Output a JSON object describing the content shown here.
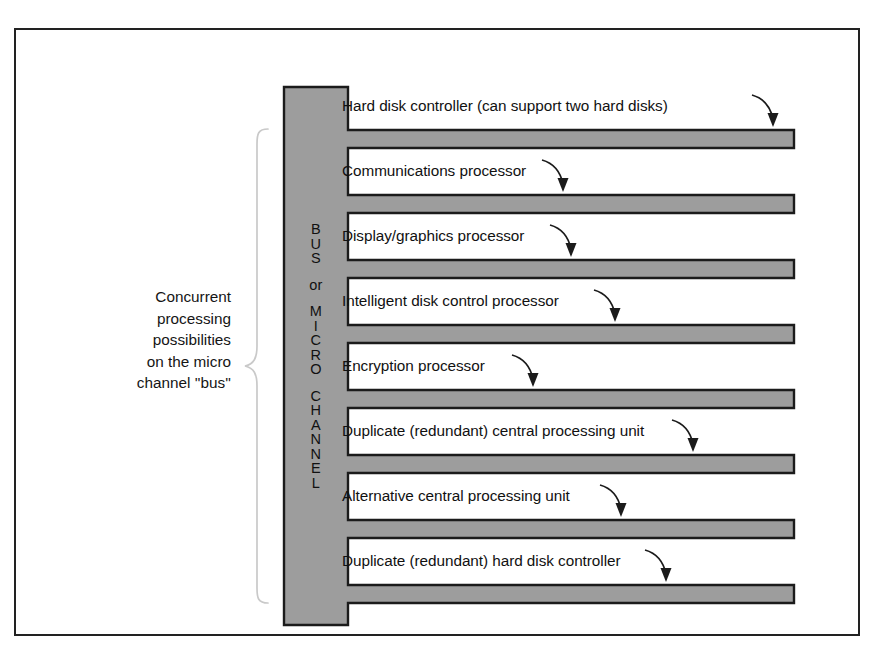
{
  "figure": {
    "caption_lines": [
      "Concurrent",
      "processing",
      "possibilities",
      "on the micro",
      "channel ''bus''"
    ],
    "bus_label_lines": [
      "B",
      "U",
      "S",
      "or",
      "M",
      "I",
      "C",
      "R",
      "O",
      "C",
      "H",
      "A",
      "N",
      "N",
      "E",
      "L"
    ],
    "bus_label_text": "BUS or MICRO CHANNEL",
    "rows": [
      {
        "label": "Hard disk controller (can support two hard disks)"
      },
      {
        "label": "Communications processor"
      },
      {
        "label": "Display/graphics processor"
      },
      {
        "label": "Intelligent disk control processor"
      },
      {
        "label": "Encryption processor"
      },
      {
        "label": "Duplicate (redundant) central processing unit"
      },
      {
        "label": "Alternative central processing unit"
      },
      {
        "label": "Duplicate (redundant) hard disk controller"
      }
    ],
    "colors": {
      "bar_fill": "#9d9d9d",
      "outline": "#1b1b1b",
      "frame": "#222222",
      "brace": "#c9c9c9",
      "text": "#111111",
      "background": "#ffffff"
    }
  }
}
